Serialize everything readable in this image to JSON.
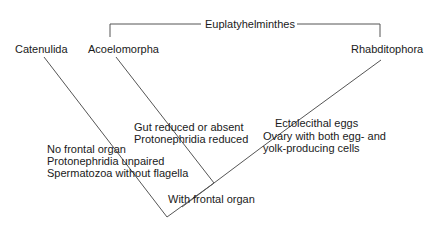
{
  "diagram": {
    "clade_bracket_label": "Euplatyhelminthes",
    "taxa": {
      "catenulida": "Catenulida",
      "acoelomorpha": "Acoelomorpha",
      "rhabditophora": "Rhabditophora"
    },
    "characters": {
      "catenulida": [
        "No frontal organ",
        "Protonephridia unpaired",
        "Spermatozoa without flagella"
      ],
      "acoelomorpha": [
        "Gut reduced or absent",
        "Protonephridia reduced"
      ],
      "rhabditophora": [
        "Ectolecithal eggs",
        "Ovary with both egg- and",
        "yolk-producing cells"
      ],
      "root_node": "With frontal organ"
    },
    "line_color": "#555555"
  }
}
